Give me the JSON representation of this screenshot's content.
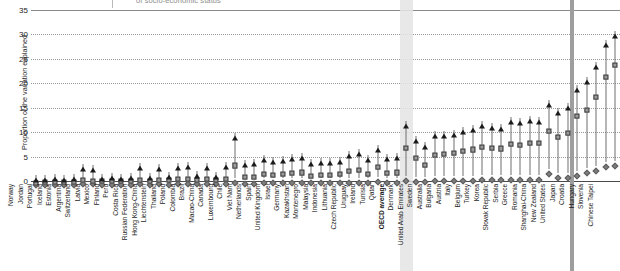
{
  "title": {
    "fragment": "of socio-economic status"
  },
  "axis": {
    "y_label": "Proportion of the variation explained",
    "y_ticks": [
      "35",
      "30",
      "25",
      "20",
      "15",
      "10",
      "5",
      "0"
    ]
  },
  "colors": {
    "triangle": "#1b1b1b",
    "square": "#9b9b9b",
    "diamond": "#7d7d7d",
    "grid": "#9a9a9a",
    "oecd_band": "#e4e4e4",
    "separator_band": "#9e9e9e"
  },
  "chart_data": {
    "type": "scatter",
    "title": "of socio-economic status",
    "xlabel": "",
    "ylabel": "Proportion of the variation explained",
    "ylim": [
      0,
      35
    ],
    "yticks": [
      0,
      5,
      10,
      15,
      20,
      25,
      30,
      35
    ],
    "grid": true,
    "legend_position": "top",
    "highlight_category": "OECD average",
    "separator_after": "United States",
    "categories": [
      "Norway",
      "Jordan",
      "Portugal",
      "Iceland",
      "Estonia",
      "Argentina",
      "Switzerland",
      "Latvia",
      "Mexico",
      "Finland",
      "Peru",
      "Costa Rica",
      "Russian Federation",
      "Hong Kong-China",
      "Liechtenstein",
      "Thailand",
      "Poland",
      "Colombia",
      "Brazil",
      "Macao-China",
      "Canada",
      "Luxembourg",
      "Chile",
      "Viet Nam",
      "Netherlands",
      "Spain",
      "United Kingdom",
      "Israel",
      "Germany",
      "Kazakhstan",
      "Montenegro",
      "Malaysia",
      "Indonesia",
      "Lithuania",
      "Czech Republic",
      "Uruguay",
      "Ireland",
      "Tunisia",
      "Qatar",
      "OECD average",
      "Denmark",
      "United Arab Emirates",
      "Sweden",
      "Australia",
      "Bulgaria",
      "Austria",
      "Italy",
      "Belgium",
      "Turkey",
      "Korea",
      "Slovak Republic",
      "Serbia",
      "Greece",
      "Romania",
      "Shanghai-China",
      "New Zealand",
      "United States",
      "Japan",
      "Croatia",
      "Hungary",
      "Slovenia",
      "Chinese Taipei"
    ],
    "series": [
      {
        "name": "triangle-series",
        "marker": "triangle",
        "values": [
          1.2,
          1.3,
          1.5,
          1.3,
          1.4,
          3.4,
          3.2,
          1.5,
          1.6,
          1.5,
          1.6,
          3.6,
          1.7,
          3.5,
          1.8,
          3.7,
          3.8,
          2.0,
          3.6,
          1.9,
          3.9,
          9.8,
          4.3,
          4.5,
          5.3,
          5.0,
          5.2,
          5.5,
          5.8,
          4.6,
          4.8,
          4.8,
          5.0,
          6.2,
          6.6,
          5.4,
          7.4,
          5.6,
          5.8,
          12.3,
          9.2,
          7.9,
          10.2,
          10.3,
          10.5,
          11.1,
          11.4,
          12.2,
          11.8,
          11.6,
          13.0,
          12.8,
          13.3,
          13.2,
          16.5,
          14.9,
          16.0,
          19.6,
          21.3,
          24.4,
          28.8,
          30.8
        ]
      },
      {
        "name": "square-series",
        "marker": "square",
        "values": [
          0.7,
          0.8,
          0.8,
          0.8,
          0.9,
          1.3,
          1.1,
          1.0,
          1.0,
          1.0,
          1.0,
          1.3,
          1.1,
          1.3,
          1.2,
          1.4,
          1.5,
          1.2,
          1.4,
          1.3,
          1.5,
          4.2,
          1.8,
          1.9,
          2.5,
          2.2,
          2.4,
          2.6,
          2.8,
          2.1,
          2.2,
          2.2,
          2.4,
          3.1,
          3.3,
          2.5,
          3.9,
          2.6,
          2.8,
          7.8,
          5.7,
          4.4,
          6.4,
          6.5,
          6.7,
          7.2,
          7.5,
          8.0,
          7.8,
          7.7,
          8.6,
          8.4,
          8.8,
          8.8,
          11.2,
          10.1,
          10.9,
          14.3,
          15.6,
          18.3,
          22.3,
          24.8
        ]
      },
      {
        "name": "diamond-series",
        "marker": "diamond",
        "values": [
          0.3,
          0.3,
          0.3,
          0.3,
          0.3,
          0.4,
          0.4,
          0.3,
          0.3,
          0.3,
          0.3,
          0.4,
          0.3,
          0.4,
          0.3,
          0.4,
          0.4,
          0.4,
          0.4,
          0.4,
          0.4,
          0.6,
          0.5,
          0.5,
          0.6,
          0.6,
          0.6,
          0.6,
          0.7,
          0.6,
          0.6,
          0.6,
          0.6,
          0.7,
          0.7,
          0.6,
          0.8,
          0.6,
          0.6,
          1.0,
          0.9,
          0.8,
          1.0,
          1.0,
          1.0,
          1.1,
          1.1,
          1.2,
          1.2,
          1.2,
          1.3,
          1.3,
          1.3,
          1.3,
          2.4,
          1.6,
          1.7,
          2.0,
          2.7,
          3.0,
          3.9,
          4.1
        ]
      }
    ]
  }
}
